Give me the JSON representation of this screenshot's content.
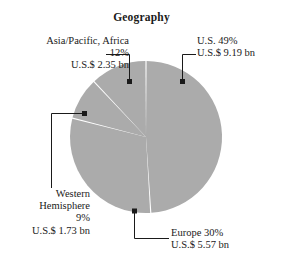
{
  "chart_data": {
    "type": "pie",
    "title": "Geography",
    "xlabel": "",
    "ylabel": "",
    "unit": "U.S.$ bn",
    "categories": [
      "U.S.",
      "Europe",
      "Western Hemisphere",
      "Asia/Pacific, Africa"
    ],
    "values": [
      49,
      30,
      9,
      12
    ],
    "amounts": [
      9.19,
      5.57,
      1.73,
      2.35
    ],
    "slice_color": "#ababab",
    "separator_color": "#ffffff",
    "legend_position": "callouts",
    "grid": false,
    "start_angle_deg": 0,
    "direction": "clockwise",
    "slices": [
      {
        "name": "U.S.",
        "percent_label": "U.S.  49%",
        "amount_label": "U.S.$ 9.19 bn",
        "percent": 49,
        "amount": 9.19
      },
      {
        "name": "Europe",
        "percent_label": "Europe  30%",
        "amount_label": "U.S.$ 5.57 bn",
        "percent": 30,
        "amount": 5.57
      },
      {
        "name": "Western Hemisphere",
        "name_line1": "Western",
        "name_line2": "Hemisphere",
        "percent_label": "9%",
        "amount_label": "U.S.$ 1.73 bn",
        "percent": 9,
        "amount": 1.73
      },
      {
        "name": "Asia/Pacific, Africa",
        "percent_label": "12%",
        "amount_label": "U.S.$ 2.35 bn",
        "percent": 12,
        "amount": 2.35
      }
    ]
  }
}
